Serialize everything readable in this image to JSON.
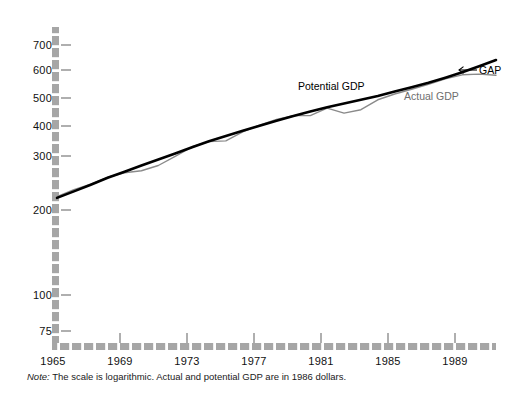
{
  "chart_data": {
    "type": "line",
    "title": "",
    "subtitle": "",
    "xlabel": "",
    "ylabel": "",
    "scale": "logarithmic",
    "grid": false,
    "legend_position": "inline-annotations",
    "x": [
      1965,
      1966,
      1967,
      1968,
      1969,
      1970,
      1971,
      1972,
      1973,
      1974,
      1975,
      1976,
      1977,
      1978,
      1979,
      1980,
      1981,
      1982,
      1983,
      1984,
      1985,
      1986,
      1987,
      1988,
      1989,
      1990,
      1991
    ],
    "xlim": [
      1965,
      1991
    ],
    "ylim": [
      70,
      780
    ],
    "ytick_values": [
      75,
      100,
      200,
      300,
      400,
      500,
      600,
      700
    ],
    "ytick_labels": [
      "75",
      "100",
      "200",
      "300",
      "400",
      "500",
      "600",
      "700"
    ],
    "xtick_values": [
      1965,
      1969,
      1973,
      1977,
      1981,
      1985,
      1989
    ],
    "xtick_labels": [
      "1965",
      "1969",
      "1973",
      "1977",
      "1981",
      "1985",
      "1989"
    ],
    "series": [
      {
        "name": "Potential GDP",
        "color": "#000000",
        "width": 2.6,
        "values": [
          213,
          224,
          236,
          249,
          261,
          274,
          287,
          301,
          316,
          331,
          345,
          359,
          373,
          388,
          403,
          417,
          431,
          444,
          457,
          471,
          487,
          504,
          522,
          543,
          566,
          593,
          623
        ]
      },
      {
        "name": "Actual GDP",
        "color": "#8a8a8a",
        "width": 1.4,
        "values": [
          215,
          227,
          237,
          250,
          259,
          263,
          274,
          294,
          317,
          330,
          332,
          356,
          375,
          392,
          404,
          404,
          428,
          412,
          423,
          457,
          478,
          496,
          515,
          538,
          555,
          558,
          553
        ]
      }
    ],
    "annotations": [
      {
        "text": "Potential GDP",
        "name": "potential-gdp-label"
      },
      {
        "text": "Actual GDP",
        "name": "actual-gdp-label"
      },
      {
        "text": "GAP",
        "name": "gap-label",
        "arrow": "←"
      }
    ],
    "note_prefix": "Note:",
    "note_text": " The scale is logarithmic. Actual and potential GDP are in 1986 dollars."
  },
  "axis": {
    "axis_color": "#9a9a9a",
    "tick_color": "#8d8d8d",
    "label_color": "#111111"
  }
}
